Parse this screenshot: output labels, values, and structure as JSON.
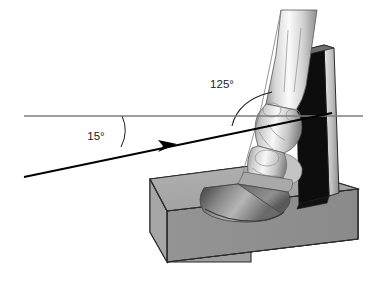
{
  "figure": {
    "background_color": "#ffffff",
    "width": 383,
    "height": 287
  },
  "annotations": {
    "beam_angle": {
      "label": "15°",
      "value": 15,
      "unit": "degrees",
      "x": 96,
      "y": 136,
      "description": "angle of x-ray beam below horizontal"
    },
    "limb_angle": {
      "label": "125°",
      "value": 125,
      "unit": "degrees",
      "x": 222,
      "y": 84,
      "description": "angle between horizontal and dorsal pastern axis"
    }
  },
  "elements": {
    "horizontal_reference_line": {
      "name": "horizontal-reference-line",
      "color": "#7d7d7d",
      "x1": 24,
      "y1": 116,
      "x2": 363,
      "y2": 116
    },
    "xray_beam": {
      "name": "xray-beam-arrow",
      "color": "#000000",
      "x1": 24,
      "y1": 177,
      "x2": 330,
      "y2": 113,
      "arrow_tip_x": 176,
      "arrow_tip_y": 145
    },
    "positioning_block": {
      "name": "positioning-block",
      "top_face_color": "#a8a8a8",
      "front_face_color": "#8f8f8f",
      "side_face_color": "#9a9a9a",
      "outline_color": "#2b2b2b"
    },
    "cassette": {
      "name": "radiographic-cassette",
      "face_color": "#0d0d0d",
      "edge_color": "#c9c9c9",
      "outline_color": "#1a1a1a"
    },
    "limb": {
      "name": "equine-distal-limb",
      "skin_light": "#f2f2f2",
      "skin_mid": "#b9b9b9",
      "skin_shadow": "#7a7a7a",
      "hoof_dark": "#5e5e5e",
      "outline_color": "#4a4a4a"
    }
  },
  "colors": {
    "accent": "#000000",
    "reference_line": "#7d7d7d",
    "block_gray": "#a0a0a0",
    "cassette_black": "#0d0d0d"
  }
}
